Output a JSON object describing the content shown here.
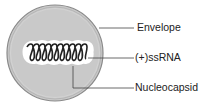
{
  "diagram": {
    "labels": {
      "envelope": "Envelope",
      "rna": "(+)ssRNA",
      "nucleocapsid": "Nucleocapsid"
    },
    "colors": {
      "envelope_fill": "#c8c8c8",
      "envelope_stroke": "#8a8a8a",
      "coil": "#222222",
      "leader": "#444444"
    }
  }
}
